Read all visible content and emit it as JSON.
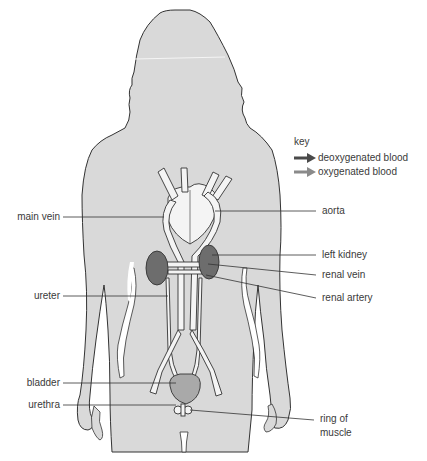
{
  "diagram": {
    "colors": {
      "background": "#ffffff",
      "body_fill": "#d9d9d9",
      "body_outline": "#333333",
      "vessel_fill": "#f4f4f4",
      "kidney_fill": "#6d6d6d",
      "bladder_fill": "#a9a9a9",
      "deoxygenated_arrow": "#4a4a4a",
      "oxygenated_arrow": "#8a8a8a",
      "leader_line": "#333333",
      "label_text": "#3a3a3a"
    },
    "key": {
      "title": "key",
      "items": [
        {
          "label": "deoxygenated blood",
          "color": "#4a4a4a",
          "icon": "arrow-right-dark"
        },
        {
          "label": "oxygenated blood",
          "color": "#8a8a8a",
          "icon": "arrow-right-light"
        }
      ]
    },
    "labels_left": [
      {
        "id": "main-vein",
        "text": "main vein"
      },
      {
        "id": "ureter",
        "text": "ureter"
      },
      {
        "id": "bladder",
        "text": "bladder"
      },
      {
        "id": "urethra",
        "text": "urethra"
      }
    ],
    "labels_right": [
      {
        "id": "aorta",
        "text": "aorta"
      },
      {
        "id": "left-kidney",
        "text": "left kidney"
      },
      {
        "id": "renal-vein",
        "text": "renal vein"
      },
      {
        "id": "renal-artery",
        "text": "renal artery"
      },
      {
        "id": "ring-of-muscle",
        "text": "ring of",
        "text2": "muscle"
      }
    ]
  }
}
